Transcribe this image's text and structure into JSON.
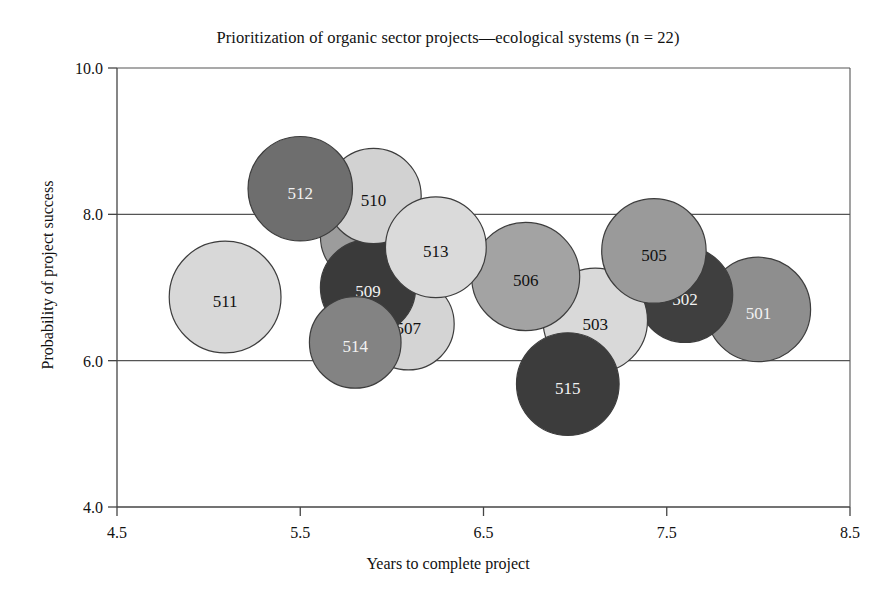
{
  "chart_data": {
    "type": "scatter",
    "title": "Prioritization of organic sector projects—ecological systems (n = 22)",
    "xlabel": "Years to complete project",
    "ylabel": "Probability of project success",
    "xlim": [
      4.5,
      8.5
    ],
    "ylim": [
      4.0,
      10.0
    ],
    "xticks": [
      "4.5",
      "5.5",
      "6.5",
      "7.5",
      "8.5"
    ],
    "yticks": [
      "4.0",
      "6.0",
      "8.0",
      "10.0"
    ],
    "grid": "horizontal gridlines at 6.0 and 8.0",
    "legend": "none",
    "bubbles": [
      {
        "label": "501",
        "x": 8.0,
        "y": 6.7,
        "size": 0.57,
        "color": "#8e8e8e",
        "label_color": "light"
      },
      {
        "label": "502",
        "x": 7.6,
        "y": 6.9,
        "size": 0.52,
        "color": "#3f3f3f",
        "label_color": "light"
      },
      {
        "label": "503",
        "x": 7.11,
        "y": 6.55,
        "size": 0.57,
        "color": "#d9d9d9",
        "label_color": "dark"
      },
      {
        "label": "504",
        "x": 5.87,
        "y": 7.7,
        "size": 0.52,
        "color": "#9c9c9c",
        "label_color": "dark"
      },
      {
        "label": "505",
        "x": 7.43,
        "y": 7.5,
        "size": 0.57,
        "color": "#9a9a9a",
        "label_color": "dark"
      },
      {
        "label": "506",
        "x": 6.73,
        "y": 7.15,
        "size": 0.59,
        "color": "#a3a3a3",
        "label_color": "dark"
      },
      {
        "label": "507",
        "x": 6.09,
        "y": 6.5,
        "size": 0.5,
        "color": "#d4d4d4",
        "label_color": "dark"
      },
      {
        "label": "509",
        "x": 5.87,
        "y": 7.0,
        "size": 0.52,
        "color": "#3a3a3a",
        "label_color": "light"
      },
      {
        "label": "510",
        "x": 5.9,
        "y": 8.25,
        "size": 0.52,
        "color": "#d2d2d2",
        "label_color": "dark"
      },
      {
        "label": "511",
        "x": 5.09,
        "y": 6.87,
        "size": 0.61,
        "color": "#d8d8d8",
        "label_color": "dark"
      },
      {
        "label": "512",
        "x": 5.5,
        "y": 8.35,
        "size": 0.57,
        "color": "#6e6e6e",
        "label_color": "light"
      },
      {
        "label": "513",
        "x": 6.24,
        "y": 7.55,
        "size": 0.55,
        "color": "#dadada",
        "label_color": "dark"
      },
      {
        "label": "514",
        "x": 5.8,
        "y": 6.25,
        "size": 0.5,
        "color": "#838383",
        "label_color": "light"
      },
      {
        "label": "515",
        "x": 6.96,
        "y": 5.68,
        "size": 0.56,
        "color": "#3c3c3c",
        "label_color": "light"
      }
    ]
  },
  "axes_geometry": {
    "plot_left": 117,
    "plot_right": 850,
    "plot_top": 68,
    "plot_bottom": 507
  }
}
